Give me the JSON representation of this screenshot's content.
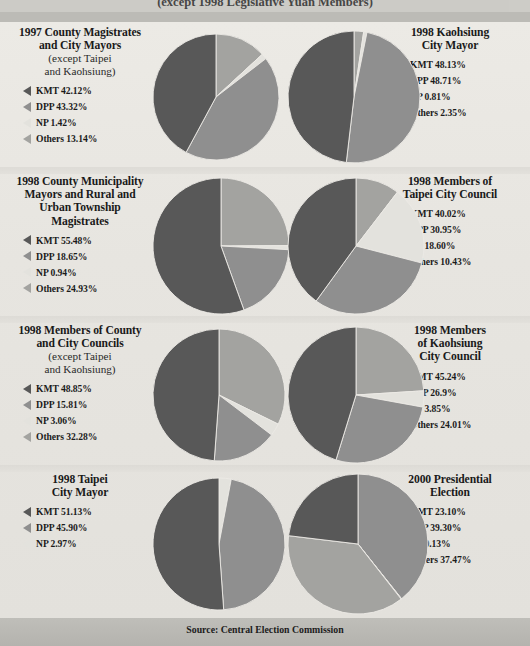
{
  "header": {
    "caption": "(except 1998 Legislative Yuan Members)"
  },
  "footer": {
    "source": "Source: Central Election Commission"
  },
  "colors": {
    "kmt": "#585858",
    "dpp": "#8f8f8f",
    "np": "#e3e2dd",
    "others": "#a3a3a0",
    "background": "#e9e8e3",
    "band": "#bcbbb6",
    "footer": "#b9b8b3"
  },
  "legend_keys": [
    "KMT",
    "DPP",
    "NP",
    "Others"
  ],
  "chart_data": [
    {
      "type": "pie",
      "title": "1997 County Magistrates and City Mayors",
      "title_line1": "1997 County Magistrates",
      "title_line2": "and City Mayors",
      "subtitle_line1": "(except Taipei",
      "subtitle_line2": "and Kaohsiung)",
      "categories": [
        "KMT",
        "DPP",
        "NP",
        "Others"
      ],
      "values": [
        42.12,
        43.32,
        1.42,
        13.14
      ],
      "labels": [
        "KMT 42.12%",
        "DPP 43.32%",
        "NP 1.42%",
        "Others 13.14%"
      ],
      "slice_colors": [
        "#585858",
        "#8f8f8f",
        "#e3e2dd",
        "#a3a3a0"
      ],
      "draw_order": [
        "Others",
        "NP",
        "DPP",
        "KMT"
      ],
      "radius": 63
    },
    {
      "type": "pie",
      "title": "1998 Kaohsiung City Mayor",
      "title_line1": "1998 Kaohsiung",
      "title_line2": "City Mayor",
      "subtitle_line1": "",
      "subtitle_line2": "",
      "categories": [
        "KMT",
        "DPP",
        "NP",
        "Others"
      ],
      "values": [
        48.13,
        48.71,
        0.81,
        2.35
      ],
      "labels": [
        "KMT 48.13%",
        "DPP 48.71%",
        "NP 0.81%",
        "Others 2.35%"
      ],
      "slice_colors": [
        "#585858",
        "#8f8f8f",
        "#e3e2dd",
        "#a3a3a0"
      ],
      "draw_order": [
        "Others",
        "NP",
        "DPP",
        "KMT"
      ],
      "radius": 66
    },
    {
      "type": "pie",
      "title": "1998 County Municipality Mayors and Rural and Urban Township Magistrates",
      "title_line1": "1998 County Municipality",
      "title_line2": "Mayors and Rural and",
      "title_line3": "Urban Township",
      "title_line4": "Magistrates",
      "subtitle_line1": "",
      "subtitle_line2": "",
      "categories": [
        "KMT",
        "DPP",
        "NP",
        "Others"
      ],
      "values": [
        55.48,
        18.65,
        0.94,
        24.93
      ],
      "labels": [
        "KMT 55.48%",
        "DPP 18.65%",
        "NP 0.94%",
        "Others 24.93%"
      ],
      "slice_colors": [
        "#585858",
        "#8f8f8f",
        "#e3e2dd",
        "#a3a3a0"
      ],
      "draw_order": [
        "Others",
        "NP",
        "DPP",
        "KMT"
      ],
      "radius": 68
    },
    {
      "type": "pie",
      "title": "1998 Members of Taipei City Council",
      "title_line1": "1998 Members of",
      "title_line2": "Taipei City Council",
      "subtitle_line1": "",
      "subtitle_line2": "",
      "categories": [
        "KMT",
        "DPP",
        "NP",
        "Others"
      ],
      "values": [
        40.02,
        30.95,
        18.6,
        10.43
      ],
      "labels": [
        "KMT 40.02%",
        "DPP 30.95%",
        "NP 18.60%",
        "Others 10.43%"
      ],
      "slice_colors": [
        "#585858",
        "#8f8f8f",
        "#e3e2dd",
        "#a3a3a0"
      ],
      "draw_order": [
        "Others",
        "NP",
        "DPP",
        "KMT"
      ],
      "radius": 68
    },
    {
      "type": "pie",
      "title": "1998 Members of County and City Councils",
      "title_line1": "1998 Members of County",
      "title_line2": "and City Councils",
      "subtitle_line1": "(except Taipei",
      "subtitle_line2": "and Kaohsiung)",
      "categories": [
        "KMT",
        "DPP",
        "NP",
        "Others"
      ],
      "values": [
        48.85,
        15.81,
        3.06,
        32.28
      ],
      "labels": [
        "KMT 48.85%",
        "DPP 15.81%",
        "NP 3.06%",
        "Others 32.28%"
      ],
      "slice_colors": [
        "#585858",
        "#8f8f8f",
        "#e3e2dd",
        "#a3a3a0"
      ],
      "draw_order": [
        "Others",
        "NP",
        "DPP",
        "KMT"
      ],
      "radius": 66
    },
    {
      "type": "pie",
      "title": "1998 Members of Kaohsiung City Council",
      "title_line1": "1998 Members",
      "title_line2": "of Kaohsiung",
      "title_line3": "City Council",
      "subtitle_line1": "",
      "subtitle_line2": "",
      "categories": [
        "KMT",
        "DPP",
        "NP",
        "Others"
      ],
      "values": [
        45.24,
        26.9,
        3.85,
        24.01
      ],
      "labels": [
        "KMT 45.24%",
        "DPP 26.9%",
        "NP 3.85%",
        "Others 24.01%"
      ],
      "slice_colors": [
        "#585858",
        "#8f8f8f",
        "#e3e2dd",
        "#a3a3a0"
      ],
      "draw_order": [
        "Others",
        "NP",
        "DPP",
        "KMT"
      ],
      "radius": 68
    },
    {
      "type": "pie",
      "title": "1998 Taipei City Mayor",
      "title_line1": "1998 Taipei",
      "title_line2": "City Mayor",
      "subtitle_line1": "",
      "subtitle_line2": "",
      "categories": [
        "KMT",
        "DPP",
        "NP"
      ],
      "values": [
        51.13,
        45.9,
        2.97
      ],
      "labels": [
        "KMT 51.13%",
        "DPP 45.90%",
        "NP 2.97%"
      ],
      "slice_colors": [
        "#585858",
        "#8f8f8f",
        "#e3e2dd"
      ],
      "draw_order": [
        "NP",
        "DPP",
        "KMT"
      ],
      "radius": 66
    },
    {
      "type": "pie",
      "title": "2000 Presidential Election",
      "title_line1": "2000 Presidential",
      "title_line2": "Election",
      "subtitle_line1": "",
      "subtitle_line2": "",
      "categories": [
        "KMT",
        "DPP",
        "NP",
        "Others"
      ],
      "values": [
        23.1,
        39.3,
        0.13,
        37.47
      ],
      "labels": [
        "KMT 23.10%",
        "DPP 39.30%",
        "NP 0.13%",
        "Others 37.47%"
      ],
      "slice_colors": [
        "#585858",
        "#8f8f8f",
        "#e3e2dd",
        "#a3a3a0"
      ],
      "draw_order": [
        "DPP",
        "NP",
        "Others",
        "KMT"
      ],
      "radius": 70
    }
  ]
}
